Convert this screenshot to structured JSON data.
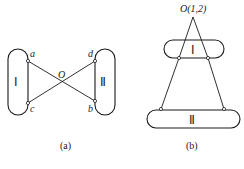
{
  "figure_a": {
    "caption": "(a)",
    "body_left_label": "Ⅰ",
    "body_right_label": "Ⅱ",
    "center_label": "O",
    "points": {
      "a": "a",
      "b": "b",
      "c": "c",
      "d": "d"
    }
  },
  "figure_b": {
    "caption": "(b)",
    "apex_label": "O(1,2)",
    "body_top_label": "Ⅰ",
    "body_bottom_label": "Ⅱ"
  },
  "colors": {
    "line": "#1a1a1a",
    "background": "#ffffff"
  }
}
